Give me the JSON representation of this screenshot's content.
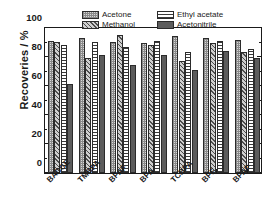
{
  "chart_data": {
    "type": "bar",
    "title": "",
    "xlabel": "",
    "ylabel": "Recoveries / %",
    "ylim": [
      0,
      100
    ],
    "yticks": [
      0,
      20,
      40,
      60,
      80,
      100
    ],
    "ytick_labels": [
      "0",
      "20",
      "40",
      "60",
      "80",
      "100"
    ],
    "grid": false,
    "legend_position": "top-inside",
    "categories": [
      "BADGE",
      "TMBPA",
      "BPAF",
      "BPA",
      "TCBPA",
      "BPF",
      "BPAP"
    ],
    "series": [
      {
        "name": "Acetone",
        "pattern": "stipple",
        "color": "#d8d8d8",
        "values": [
          90,
          92,
          89,
          88.5,
          93,
          92,
          90.5
        ]
      },
      {
        "name": "Methanol",
        "pattern": "diagonal-hatch",
        "color": "#cfcfcf",
        "values": [
          89,
          78.5,
          94,
          87,
          76,
          88.5,
          82
        ]
      },
      {
        "name": "Ethyl acetate",
        "pattern": "horizontal-lines",
        "color": "#ffffff",
        "values": [
          87,
          89,
          85.5,
          90,
          82.5,
          89.5,
          84.5
        ]
      },
      {
        "name": "Acetonitrile",
        "pattern": "solid",
        "color": "#5c5c5c",
        "values": [
          60.5,
          80,
          73.5,
          80,
          70,
          83,
          78
        ]
      }
    ]
  },
  "legend": {
    "entries": [
      {
        "label": "Acetone"
      },
      {
        "label": "Ethyl acetate"
      },
      {
        "label": "Methanol"
      },
      {
        "label": "Acetonitrile"
      }
    ]
  }
}
